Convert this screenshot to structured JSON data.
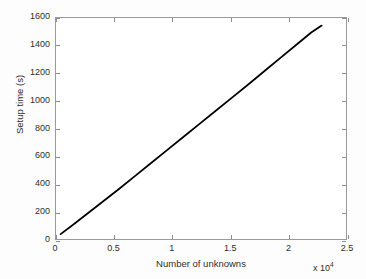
{
  "chart_data": {
    "type": "line",
    "title": "",
    "xlabel": "Number of unknowns",
    "ylabel": "Setup time (s)",
    "x_multiplier": "x 10",
    "x_multiplier_exponent": "4",
    "xlim": [
      0,
      25000
    ],
    "ylim": [
      0,
      1600
    ],
    "xticks": [
      0,
      5000,
      10000,
      15000,
      20000,
      25000
    ],
    "xtick_labels": [
      "0",
      "0.5",
      "1",
      "1.5",
      "2",
      "2.5"
    ],
    "yticks": [
      0,
      200,
      400,
      600,
      800,
      1000,
      1200,
      1400,
      1600
    ],
    "ytick_labels": [
      "0",
      "200",
      "400",
      "600",
      "800",
      "1000",
      "1200",
      "1400",
      "1600"
    ],
    "grid": false,
    "legend": null,
    "series": [
      {
        "name": "Setup time",
        "color": "#000000",
        "line_width": 1.8,
        "x": [
          400,
          1500,
          2800,
          4100,
          5400,
          6800,
          8200,
          9600,
          11000,
          12400,
          13800,
          15200,
          16600,
          18000,
          19400,
          20800,
          22000,
          22900
        ],
        "y": [
          35,
          105,
          190,
          275,
          360,
          455,
          550,
          645,
          740,
          835,
          930,
          1025,
          1120,
          1218,
          1315,
          1412,
          1495,
          1545
        ]
      }
    ]
  },
  "figure": {
    "background_color": "#fdfdfd",
    "axes_color": "#9a9a9a",
    "text_color": "#2e2e2e"
  }
}
